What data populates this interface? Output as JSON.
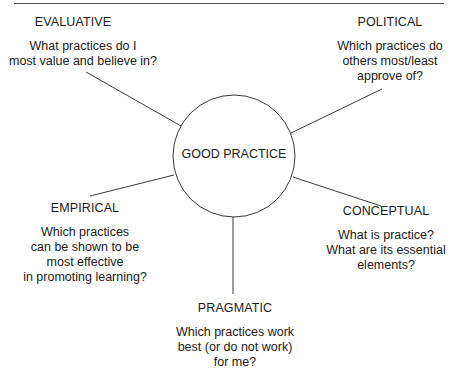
{
  "diagram": {
    "center": {
      "label": "GOOD PRACTICE"
    },
    "nodes": [
      {
        "id": "evaluative",
        "title": "EVALUATIVE",
        "question_lines": [
          "What practices do I",
          "most value and believe in?"
        ]
      },
      {
        "id": "political",
        "title": "POLITICAL",
        "question_lines": [
          "Which practices do",
          "others most/least",
          "approve of?"
        ]
      },
      {
        "id": "empirical",
        "title": "EMPIRICAL",
        "question_lines": [
          "Which practices",
          "can be shown to be",
          "most effective",
          "in promoting learning?"
        ]
      },
      {
        "id": "conceptual",
        "title": "CONCEPTUAL",
        "question_lines": [
          "What is practice?",
          "What are its essential",
          "elements?"
        ]
      },
      {
        "id": "pragmatic",
        "title": "PRAGMATIC",
        "question_lines": [
          "Which practices work",
          "best (or do not work)",
          "for me?"
        ]
      }
    ],
    "colors": {
      "line": "#3a3a3a",
      "text": "#1a1a1a",
      "background": "#ffffff"
    }
  }
}
